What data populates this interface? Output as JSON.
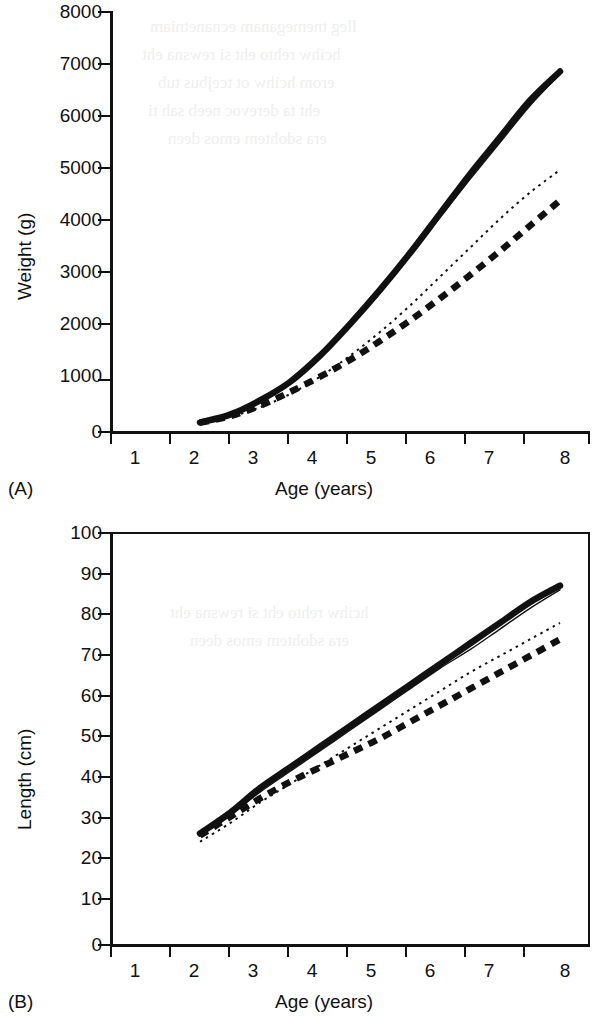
{
  "figure": {
    "panels": [
      {
        "id": "A",
        "tag": "(A)",
        "xlabel": "Age (years)",
        "ylabel": "Weight (g)"
      },
      {
        "id": "B",
        "tag": "(B)",
        "xlabel": "Age (years)",
        "ylabel": "Length (cm)"
      }
    ],
    "ink_color": "#111111"
  },
  "chart_data": [
    {
      "type": "line",
      "panel": "(A)",
      "title": "",
      "xlabel": "Age (years)",
      "ylabel": "Weight (g)",
      "xlim": [
        0.5,
        8.5
      ],
      "ylim": [
        0,
        8000
      ],
      "xticks": [
        1,
        2,
        3,
        4,
        5,
        6,
        7,
        8
      ],
      "yticks": [
        0,
        1000,
        2000,
        3000,
        4000,
        5000,
        6000,
        7000,
        8000
      ],
      "xtick_labels": [
        "1",
        "2",
        "3",
        "4",
        "5",
        "6",
        "7",
        "8"
      ],
      "ytick_labels": [
        "0",
        "1000",
        "2000",
        "3000",
        "4000",
        "5000",
        "6000",
        "7000",
        "8000"
      ],
      "grid": false,
      "legend": "none",
      "x": [
        2,
        2.5,
        3,
        3.5,
        4,
        4.5,
        5,
        5.5,
        6,
        6.5,
        7,
        7.5,
        8
      ],
      "series": [
        {
          "name": "thick-solid",
          "style": "thick solid",
          "values": [
            180,
            330,
            600,
            950,
            1450,
            2050,
            2700,
            3400,
            4150,
            4900,
            5600,
            6300,
            6850
          ]
        },
        {
          "name": "thin-solid",
          "style": "thin solid",
          "values": [
            180,
            330,
            590,
            930,
            1420,
            2000,
            2650,
            3350,
            4080,
            4800,
            5500,
            6200,
            6800
          ]
        },
        {
          "name": "fine-dotted",
          "style": "fine dotted",
          "values": [
            170,
            290,
            470,
            720,
            1050,
            1450,
            1900,
            2400,
            2950,
            3500,
            4050,
            4550,
            4980
          ]
        },
        {
          "name": "thick-dashed",
          "style": "thick dashed",
          "values": [
            175,
            300,
            500,
            760,
            1050,
            1370,
            1730,
            2120,
            2540,
            2980,
            3440,
            3920,
            4400
          ]
        }
      ]
    },
    {
      "type": "line",
      "panel": "(B)",
      "title": "",
      "xlabel": "Age (years)",
      "ylabel": "Length (cm)",
      "xlim": [
        0.5,
        8.5
      ],
      "ylim": [
        0,
        100
      ],
      "xticks": [
        1,
        2,
        3,
        4,
        5,
        6,
        7,
        8
      ],
      "yticks": [
        0,
        10,
        20,
        30,
        40,
        50,
        60,
        70,
        80,
        90,
        100
      ],
      "xtick_labels": [
        "1",
        "2",
        "3",
        "4",
        "5",
        "6",
        "7",
        "8"
      ],
      "ytick_labels": [
        "0",
        "10",
        "20",
        "30",
        "40",
        "50",
        "60",
        "70",
        "80",
        "90",
        "100"
      ],
      "grid": false,
      "legend": "none",
      "x": [
        2,
        2.5,
        3,
        3.5,
        4,
        4.5,
        5,
        5.5,
        6,
        6.5,
        7,
        7.5,
        8
      ],
      "series": [
        {
          "name": "thick-solid",
          "style": "thick solid",
          "values": [
            27,
            32,
            38,
            43,
            48,
            53,
            58,
            63,
            68,
            73,
            78,
            83,
            87
          ]
        },
        {
          "name": "thin-solid",
          "style": "thin solid",
          "values": [
            26.5,
            31.5,
            37,
            42,
            47,
            52,
            57,
            62,
            67,
            71.5,
            76.5,
            81.5,
            86
          ]
        },
        {
          "name": "fine-dotted",
          "style": "fine dotted",
          "values": [
            25,
            29.5,
            34.5,
            39,
            43.5,
            48,
            52.5,
            57,
            61.5,
            66,
            70,
            74,
            78
          ]
        },
        {
          "name": "thick-dashed",
          "style": "thick dashed",
          "values": [
            26.5,
            31,
            35.5,
            39.5,
            43,
            46.5,
            50,
            54,
            58,
            62,
            66,
            70,
            74
          ]
        }
      ]
    }
  ],
  "bleed_text": {
    "note": "faint show-through text from reverse of page",
    "lines": [
      "lleg tnemeganam ecnanetniam",
      "hcihw rehto eht si rewsna eht",
      "erom hcihw ot tcejbus tub",
      "eht ta derevoc neeb sah ti",
      "era sdohtem emos deen"
    ]
  }
}
